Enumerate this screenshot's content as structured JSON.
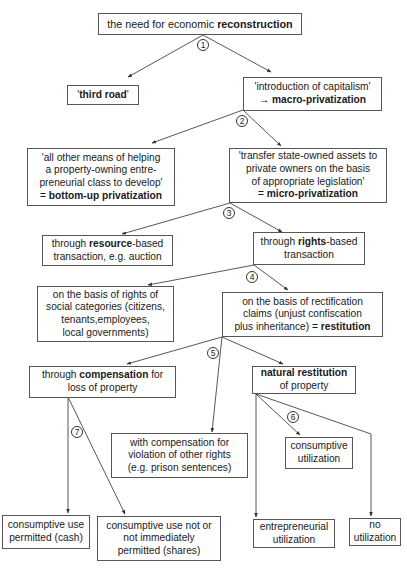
{
  "diagram": {
    "type": "tree-flowchart",
    "nodes": {
      "root": {
        "lines": [
          [
            "the need for economic ",
            "reconstruction"
          ]
        ]
      },
      "third_road": {
        "lines": [
          [
            "'",
            "third road",
            "'"
          ]
        ]
      },
      "capitalism": {
        "lines": [
          [
            "'introduction of capitalism'"
          ],
          [
            "→ ",
            "macro-privatization"
          ]
        ]
      },
      "bottom_up": {
        "lines": [
          [
            "'all other means of helping"
          ],
          [
            "a property-owning entre-"
          ],
          [
            "preneurial class to develop'"
          ],
          [
            "= ",
            "bottom-up privatization"
          ]
        ]
      },
      "micro": {
        "lines": [
          [
            "'transfer state-owned assets to"
          ],
          [
            "private owners on the basis"
          ],
          [
            "of appropriate legislation'"
          ],
          [
            "= ",
            "micro-privatization"
          ]
        ]
      },
      "resource": {
        "lines": [
          [
            "through ",
            "resource",
            "-based"
          ],
          [
            "transaction, e.g. auction"
          ]
        ]
      },
      "rights": {
        "lines": [
          [
            "through ",
            "rights",
            "-based"
          ],
          [
            "transaction"
          ]
        ]
      },
      "social": {
        "lines": [
          [
            "on the basis of rights of"
          ],
          [
            "social categories (citizens,"
          ],
          [
            "tenants,employees,"
          ],
          [
            "local governments)"
          ]
        ]
      },
      "restitution": {
        "lines": [
          [
            "on the basis of rectification"
          ],
          [
            "claims (unjust confiscation"
          ],
          [
            "plus inheritance) = ",
            "restitution"
          ]
        ]
      },
      "compensation": {
        "lines": [
          [
            "through ",
            "compensation",
            " for"
          ],
          [
            "loss of property"
          ]
        ]
      },
      "natural": {
        "lines": [
          [
            "natural restitution"
          ],
          [
            "of property"
          ]
        ]
      },
      "other_rights": {
        "lines": [
          [
            "with compensation for"
          ],
          [
            "violation of other rights"
          ],
          [
            "(e.g. prison sentences)"
          ]
        ]
      },
      "consumptive": {
        "lines": [
          [
            "consumptive"
          ],
          [
            "utilization"
          ]
        ]
      },
      "cash": {
        "lines": [
          [
            "consumptive use"
          ],
          [
            "permitted (cash)"
          ]
        ]
      },
      "shares": {
        "lines": [
          [
            "consumptive use not or"
          ],
          [
            "not immediately"
          ],
          [
            "permitted (shares)"
          ]
        ]
      },
      "entrepreneurial": {
        "lines": [
          [
            "entrepreneurial"
          ],
          [
            "utilization"
          ]
        ]
      },
      "no_util": {
        "lines": [
          [
            "no"
          ],
          [
            "utilization"
          ]
        ]
      }
    },
    "step_numbers": [
      "1",
      "2",
      "3",
      "4",
      "5",
      "6",
      "7"
    ],
    "edges": [
      {
        "from": "root",
        "to": "third_road",
        "step": "1"
      },
      {
        "from": "root",
        "to": "capitalism",
        "step": "1"
      },
      {
        "from": "capitalism",
        "to": "bottom_up",
        "step": "2"
      },
      {
        "from": "capitalism",
        "to": "micro",
        "step": "2"
      },
      {
        "from": "micro",
        "to": "resource",
        "step": "3"
      },
      {
        "from": "micro",
        "to": "rights",
        "step": "3"
      },
      {
        "from": "rights",
        "to": "social",
        "step": "4"
      },
      {
        "from": "rights",
        "to": "restitution",
        "step": "4"
      },
      {
        "from": "restitution",
        "to": "compensation",
        "step": "5"
      },
      {
        "from": "restitution",
        "to": "other_rights",
        "step": "5"
      },
      {
        "from": "restitution",
        "to": "natural",
        "step": "5"
      },
      {
        "from": "natural",
        "to": "consumptive",
        "step": "6"
      },
      {
        "from": "natural",
        "to": "entrepreneurial",
        "step": "6"
      },
      {
        "from": "natural",
        "to": "no_util",
        "step": "6"
      },
      {
        "from": "compensation",
        "to": "cash",
        "step": "7"
      },
      {
        "from": "compensation",
        "to": "shares",
        "step": "7"
      }
    ],
    "colors": {
      "line": "#444444",
      "border": "#555555",
      "text": "#1a1a1a",
      "background": "#ffffff"
    }
  }
}
